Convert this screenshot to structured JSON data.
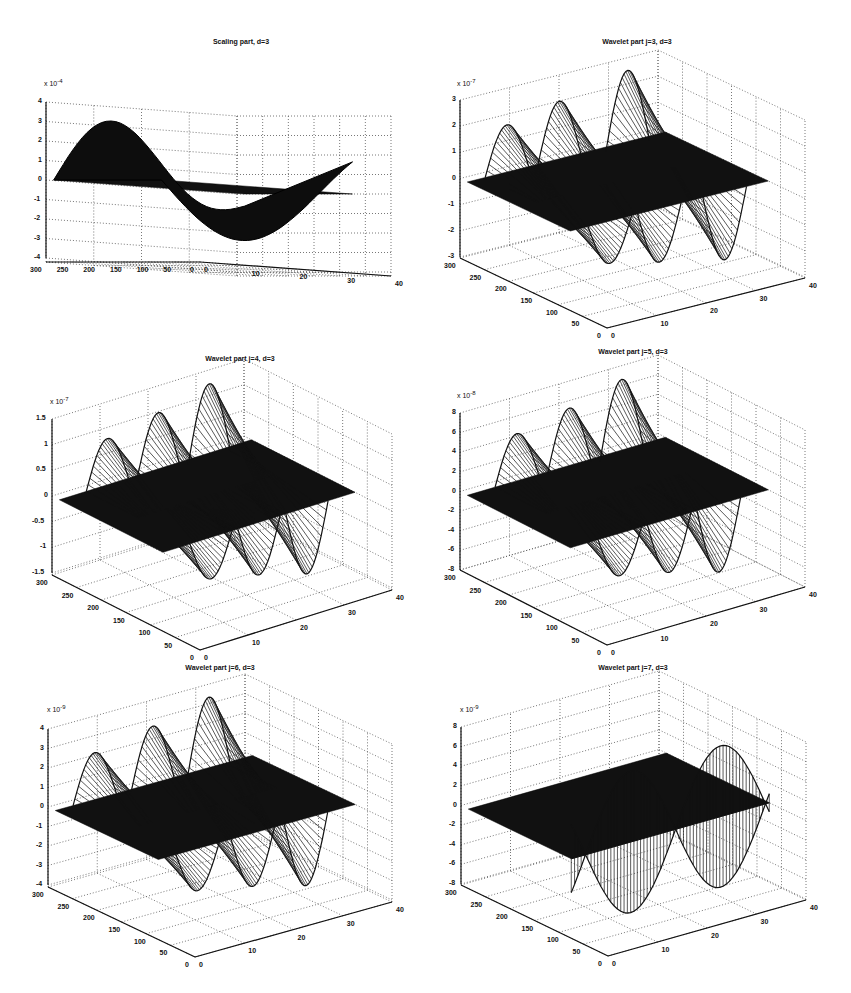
{
  "figure": {
    "layout": "3x2 grid of 3D mesh surface plots",
    "background": "#ffffff",
    "surface_color": "#111111",
    "grid_style": "dotted"
  },
  "chart_data": [
    {
      "type": "surface3d",
      "title": "Scaling part, d=3",
      "z_multiplier": "x 10^-4",
      "z_exponent": "-4",
      "zticks": [
        "4",
        "3",
        "2",
        "1",
        "0",
        "-1",
        "-2",
        "-3",
        "-4"
      ],
      "zlim": [
        -4,
        4
      ],
      "xticks_left": [
        "300",
        "250",
        "200",
        "150",
        "100",
        "50",
        "0"
      ],
      "xlim_left": [
        0,
        300
      ],
      "yticks_right": [
        "0",
        "10",
        "20",
        "30",
        "40"
      ],
      "ylim_right": [
        0,
        40
      ],
      "grid": true,
      "style": "dense-dark",
      "description": "smooth surface with two broad humps along the back (peak ~3.5e-4) and a trough near front (~-3.5e-4)"
    },
    {
      "type": "surface3d",
      "title": "Wavelet part j=3, d=3",
      "z_multiplier": "x 10^-7",
      "z_exponent": "-7",
      "zticks": [
        "3",
        "2",
        "1",
        "0",
        "-1",
        "-2",
        "-3"
      ],
      "zlim": [
        -3,
        3
      ],
      "xticks_left": [
        "300",
        "250",
        "200",
        "150",
        "100",
        "50",
        "0"
      ],
      "xlim_left": [
        0,
        300
      ],
      "yticks_right": [
        "0",
        "10",
        "20",
        "30",
        "40"
      ],
      "ylim_right": [
        0,
        40
      ],
      "grid": true,
      "style": "mesh",
      "description": "oscillating mesh with three back peaks (~1.7, 2.3, 3 e-7) and front lobes to ~-3e-7"
    },
    {
      "type": "surface3d",
      "title": "Wavelet part j=4, d=3",
      "z_multiplier": "x 10^-7",
      "z_exponent": "-7",
      "zticks": [
        "1.5",
        "1",
        "0.5",
        "0",
        "-0.5",
        "-1",
        "-1.5"
      ],
      "zlim": [
        -1.5,
        1.5
      ],
      "xticks_left": [
        "300",
        "250",
        "200",
        "150",
        "100",
        "50",
        "0"
      ],
      "xlim_left": [
        0,
        300
      ],
      "yticks_right": [
        "0",
        "10",
        "20",
        "30",
        "40"
      ],
      "ylim_right": [
        0,
        40
      ],
      "grid": true,
      "style": "mesh",
      "description": "three back peaks (~0.7, 1.0, 1.4 e-7), negative lobes near -1.2e-7"
    },
    {
      "type": "surface3d",
      "title": "Wavelet part j=5, d=3",
      "z_multiplier": "x 10^-8",
      "z_exponent": "-8",
      "zticks": [
        "8",
        "6",
        "4",
        "2",
        "0",
        "-2",
        "-4",
        "-6",
        "-8"
      ],
      "zlim": [
        -8,
        8
      ],
      "xticks_left": [
        "300",
        "250",
        "200",
        "150",
        "100",
        "50",
        "0"
      ],
      "xlim_left": [
        0,
        300
      ],
      "yticks_right": [
        "0",
        "10",
        "20",
        "30",
        "40"
      ],
      "ylim_right": [
        0,
        40
      ],
      "grid": true,
      "style": "striped",
      "description": "three back peaks (~5, 6, 7.5 e-8), front trough ~-8e-8"
    },
    {
      "type": "surface3d",
      "title": "Wavelet part j=6, d=3",
      "z_multiplier": "x 10^-9",
      "z_exponent": "-9",
      "zticks": [
        "4",
        "3",
        "2",
        "1",
        "0",
        "-1",
        "-2",
        "-3",
        "-4"
      ],
      "zlim": [
        -4,
        4
      ],
      "xticks_left": [
        "300",
        "250",
        "200",
        "150",
        "100",
        "50",
        "0"
      ],
      "xlim_left": [
        0,
        300
      ],
      "yticks_right": [
        "0",
        "10",
        "20",
        "30",
        "40"
      ],
      "ylim_right": [
        0,
        40
      ],
      "grid": true,
      "style": "striped",
      "description": "three back peaks (~2, 3, 4 e-9), front trough ~-4e-9"
    },
    {
      "type": "surface3d",
      "title": "Wavelet part j=7, d=3",
      "z_multiplier": "x 10^-9",
      "z_exponent": "-9",
      "zticks": [
        "8",
        "6",
        "4",
        "2",
        "0",
        "-2",
        "-4",
        "-6",
        "-8"
      ],
      "zlim": [
        -8,
        8
      ],
      "xticks_left": [
        "300",
        "250",
        "200",
        "150",
        "100",
        "50",
        "0"
      ],
      "xlim_left": [
        0,
        300
      ],
      "yticks_right": [
        "0",
        "10",
        "20",
        "30",
        "40"
      ],
      "ylim_right": [
        0,
        40
      ],
      "grid": true,
      "style": "striped",
      "description": "flat dark plane with sinusoid along front edge, amplitude ~7e-9, peaks around y=20 and y=40, trough near y=10"
    }
  ],
  "panels": [
    {
      "title": "Scaling part, d=3",
      "exp": "-4",
      "zticks": [
        "4",
        "3",
        "2",
        "1",
        "0",
        "-1",
        "-2",
        "-3",
        "-4"
      ]
    },
    {
      "title": "Wavelet part j=3, d=3",
      "exp": "-7",
      "zticks": [
        "3",
        "2",
        "1",
        "0",
        "-1",
        "-2",
        "-3"
      ]
    },
    {
      "title": "Wavelet part j=4, d=3",
      "exp": "-7",
      "zticks": [
        "1.5",
        "1",
        "0.5",
        "0",
        "-0.5",
        "-1",
        "-1.5"
      ]
    },
    {
      "title": "Wavelet part j=5, d=3",
      "exp": "-8",
      "zticks": [
        "8",
        "6",
        "4",
        "2",
        "0",
        "-2",
        "-4",
        "-6",
        "-8"
      ]
    },
    {
      "title": "Wavelet part j=6, d=3",
      "exp": "-9",
      "zticks": [
        "4",
        "3",
        "2",
        "1",
        "0",
        "-1",
        "-2",
        "-3",
        "-4"
      ]
    },
    {
      "title": "Wavelet part j=7, d=3",
      "exp": "-9",
      "zticks": [
        "8",
        "6",
        "4",
        "2",
        "0",
        "-2",
        "-4",
        "-6",
        "-8"
      ]
    }
  ],
  "axis": {
    "left_ticks": [
      "300",
      "250",
      "200",
      "150",
      "100",
      "50",
      "0"
    ],
    "right_ticks": [
      "0",
      "10",
      "20",
      "30",
      "40"
    ],
    "times_ten": "x 10"
  }
}
